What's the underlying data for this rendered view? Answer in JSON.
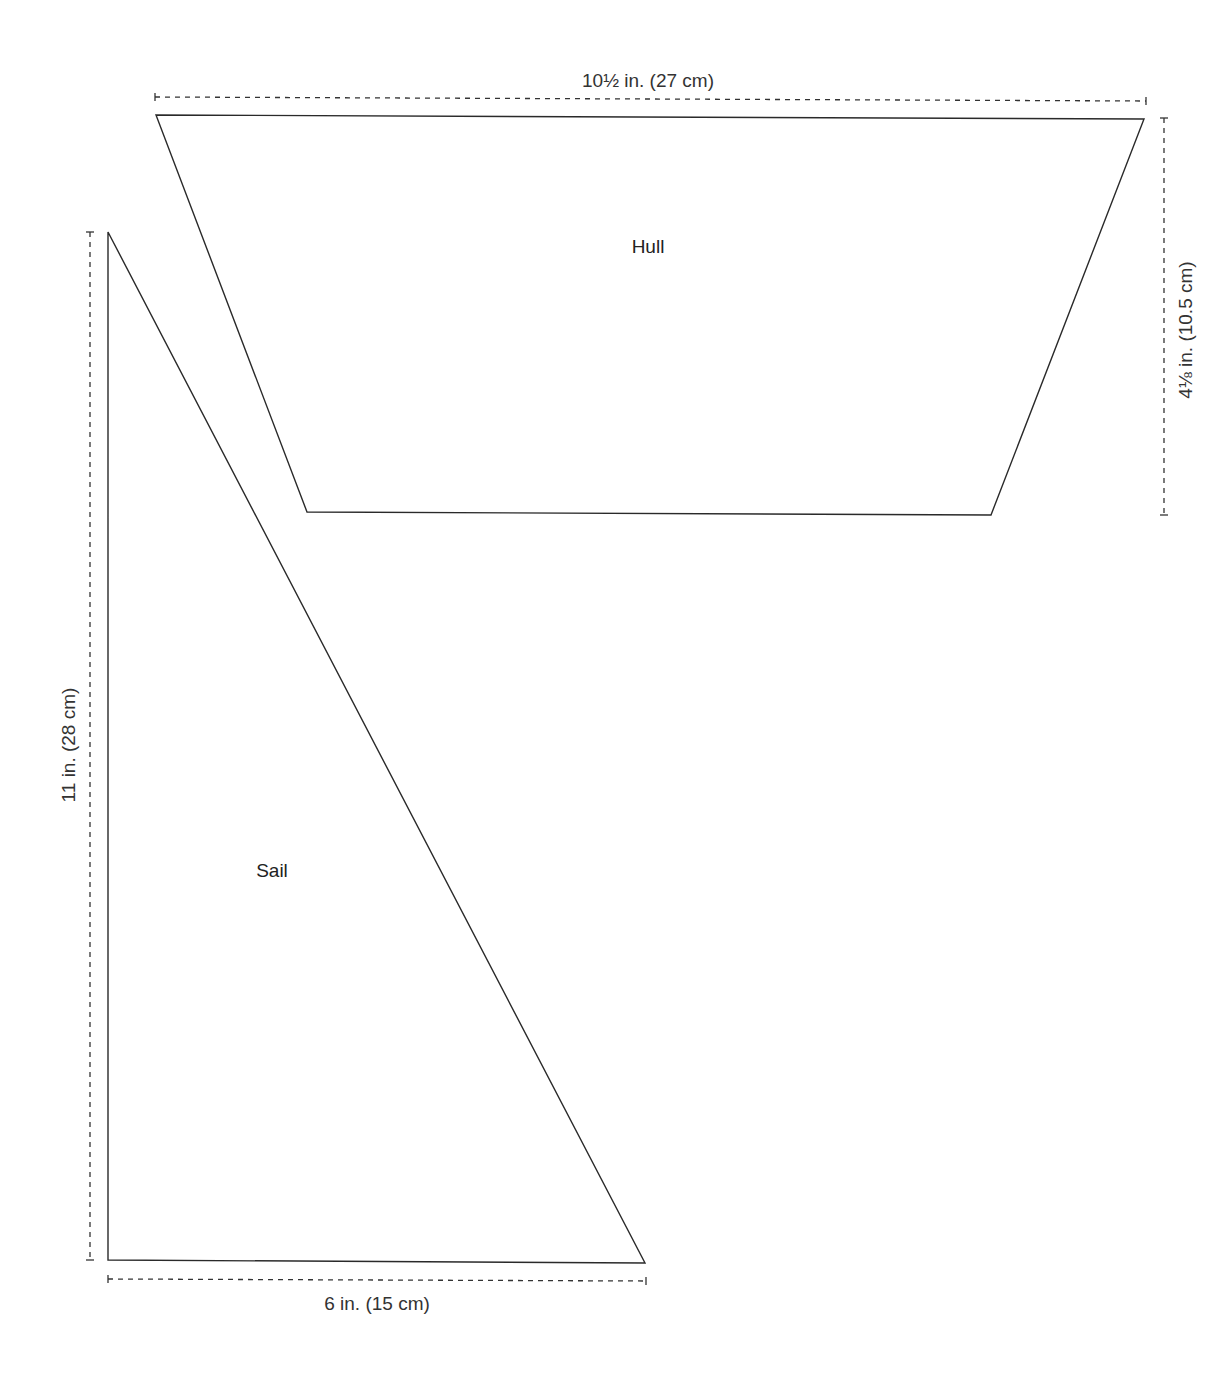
{
  "diagram": {
    "type": "pattern-template",
    "pieces": [
      {
        "name": "Hull",
        "label": "Hull",
        "shape": "trapezoid",
        "points": [
          [
            156,
            115
          ],
          [
            1144,
            119
          ],
          [
            991,
            515
          ],
          [
            307,
            512
          ]
        ],
        "dimensions": {
          "width": "10½ in. (27 cm)",
          "height": "4⅛ in. (10.5 cm)"
        }
      },
      {
        "name": "Sail",
        "label": "Sail",
        "shape": "right-triangle",
        "points": [
          [
            108,
            232
          ],
          [
            108,
            1260
          ],
          [
            645,
            1263
          ]
        ],
        "dimensions": {
          "height": "11 in. (28 cm)",
          "width": "6 in. (15 cm)"
        }
      }
    ],
    "colors": {
      "line": "#2a2a2a",
      "dimension": "#333333",
      "background": "#ffffff"
    }
  }
}
